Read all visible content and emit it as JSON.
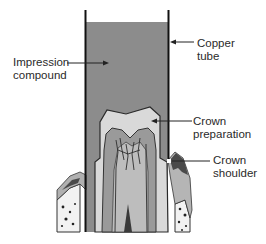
{
  "diagram": {
    "labels": {
      "impression_compound": "Impression\ncompound",
      "copper_tube": "Copper\ntube",
      "crown_preparation": "Crown\npreparation",
      "crown_shoulder": "Crown\nshoulder"
    },
    "colors": {
      "background": "#ffffff",
      "compound": "#8c8c8c",
      "tube": "#111111",
      "preparation": "#d9d9d9",
      "dentin": "#9a9a9a",
      "pulp": "#bdbdbd",
      "gum": "#5a5a5a",
      "bone": "#f2f2f2"
    }
  }
}
